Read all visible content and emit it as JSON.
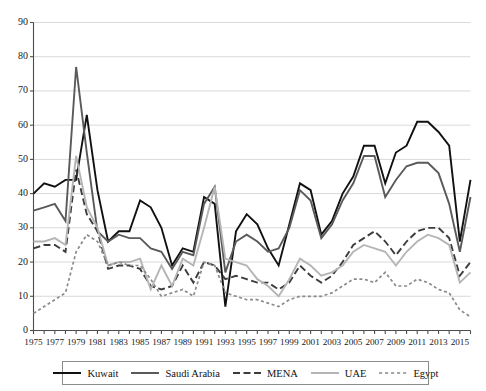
{
  "chart_data": {
    "type": "line",
    "title": "",
    "xlabel": "",
    "ylabel": "",
    "ylim": [
      0,
      90
    ],
    "ytick_step": 10,
    "grid": true,
    "legend_position": "bottom",
    "xlim": [
      1975,
      2016
    ],
    "x": [
      1975,
      1976,
      1977,
      1978,
      1979,
      1980,
      1981,
      1982,
      1983,
      1984,
      1985,
      1986,
      1987,
      1988,
      1989,
      1990,
      1991,
      1992,
      1993,
      1994,
      1995,
      1996,
      1997,
      1998,
      1999,
      2000,
      2001,
      2002,
      2003,
      2004,
      2005,
      2006,
      2007,
      2008,
      2009,
      2010,
      2011,
      2012,
      2013,
      2014,
      2015,
      2016
    ],
    "xticklabels": [
      "1975",
      "",
      "1977",
      "",
      "1979",
      "",
      "1981",
      "",
      "1983",
      "",
      "1985",
      "",
      "1987",
      "",
      "1989",
      "",
      "1991",
      "",
      "1993",
      "",
      "1995",
      "",
      "1997",
      "",
      "1999",
      "",
      "2001",
      "",
      "2003",
      "",
      "2005",
      "",
      "2007",
      "",
      "2009",
      "",
      "2011",
      "",
      "2013",
      "",
      "2015",
      ""
    ],
    "yticklabels": [
      "0",
      "10",
      "20",
      "30",
      "40",
      "50",
      "60",
      "70",
      "80",
      "90"
    ],
    "series": [
      {
        "name": "Kuwait",
        "color": "#111111",
        "style": "solid",
        "width": 1.9,
        "values": [
          40,
          43,
          42,
          44,
          44,
          63,
          41,
          26,
          29,
          29,
          38,
          36,
          30,
          19,
          24,
          23,
          39,
          37,
          7,
          29,
          34,
          31,
          24,
          19,
          31,
          43,
          41,
          28,
          32,
          40,
          45,
          54,
          54,
          43,
          52,
          54,
          61,
          61,
          58,
          54,
          26,
          44
        ]
      },
      {
        "name": "Saudi Arabia",
        "color": "#5a5a5a",
        "style": "solid",
        "width": 1.9,
        "values": [
          35,
          36,
          37,
          32,
          77,
          52,
          29,
          26,
          28,
          27,
          27,
          24,
          23,
          18,
          23,
          22,
          37,
          42,
          17,
          26,
          28,
          26,
          23,
          24,
          30,
          41,
          38,
          27,
          31,
          38,
          43,
          51,
          51,
          39,
          44,
          48,
          49,
          49,
          46,
          37,
          23,
          39
        ]
      },
      {
        "name": "MENA",
        "color": "#3c3c3c",
        "style": "dashed",
        "width": 1.9,
        "values": [
          24,
          25,
          25,
          23,
          47,
          34,
          29,
          18,
          19,
          19,
          18,
          13,
          12,
          13,
          19,
          14,
          20,
          19,
          15,
          16,
          15,
          14,
          14,
          12,
          14,
          19,
          16,
          14,
          16,
          20,
          25,
          27,
          29,
          26,
          22,
          26,
          29,
          30,
          30,
          27,
          16,
          20
        ]
      },
      {
        "name": "UAE",
        "color": "#b5b5b5",
        "style": "solid",
        "width": 1.9,
        "values": [
          26,
          26,
          27,
          25,
          51,
          36,
          30,
          19,
          20,
          20,
          21,
          12,
          19,
          13,
          21,
          19,
          30,
          42,
          21,
          20,
          19,
          15,
          13,
          10,
          15,
          21,
          19,
          16,
          17,
          19,
          23,
          25,
          24,
          23,
          19,
          23,
          26,
          28,
          27,
          25,
          14,
          17
        ]
      },
      {
        "name": "Egypt",
        "color": "#8a8a8a",
        "style": "dotted",
        "width": 1.7,
        "values": [
          5,
          7,
          9,
          11,
          23,
          28,
          26,
          19,
          20,
          19,
          19,
          15,
          10,
          11,
          12,
          10,
          20,
          19,
          11,
          10,
          9,
          9,
          8,
          7,
          9,
          10,
          10,
          10,
          11,
          13,
          15,
          15,
          14,
          17,
          13,
          13,
          15,
          14,
          12,
          11,
          6,
          4
        ]
      }
    ]
  },
  "legend": {
    "items": [
      {
        "label": "Kuwait",
        "color": "#111111",
        "style": "solid"
      },
      {
        "label": "Saudi Arabia",
        "color": "#5a5a5a",
        "style": "solid"
      },
      {
        "label": "MENA",
        "color": "#3c3c3c",
        "style": "dashed"
      },
      {
        "label": "UAE",
        "color": "#b5b5b5",
        "style": "solid"
      },
      {
        "label": "Egypt",
        "color": "#8a8a8a",
        "style": "dotted"
      }
    ]
  },
  "axes": {
    "grid_color": "#d9d9d9",
    "axis_color": "#4d4d4d",
    "tick_color": "#4d4d4d"
  }
}
